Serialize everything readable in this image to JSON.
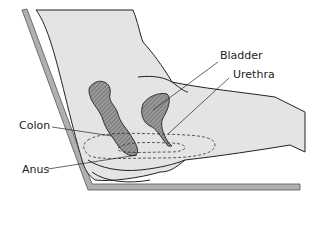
{
  "diagram": {
    "labels": {
      "bladder": "Bladder",
      "urethra": "Urethra",
      "colon": "Colon",
      "anus": "Anus"
    },
    "colors": {
      "body_fill": "#e4e4e4",
      "organ_fill": "#8a8a8a",
      "seat_fill": "#b0b0b0",
      "outline": "#222222"
    }
  }
}
